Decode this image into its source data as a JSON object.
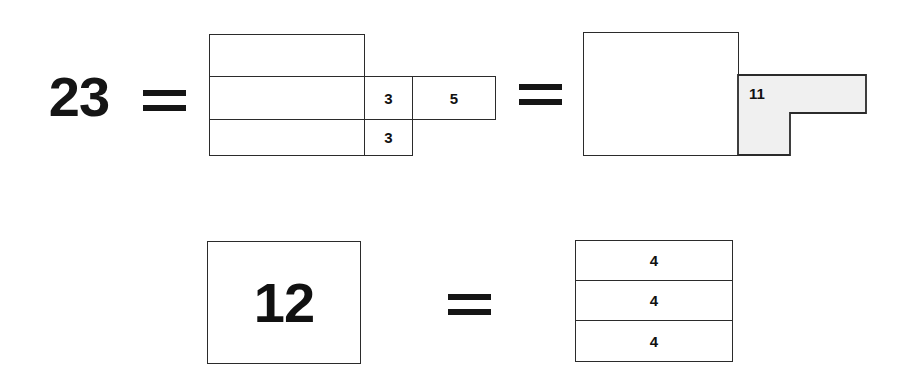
{
  "figure": {
    "background_color": "#ffffff",
    "line_color": "#2b2b2b",
    "text_color": "#111111",
    "shade_color": "#f0f0f0"
  },
  "equation_top": {
    "left_value": "23",
    "equals_1": "=",
    "equals_2": "=",
    "middle_group": {
      "block_rows": [
        "",
        "",
        ""
      ],
      "side_cells": [
        {
          "label": "3"
        },
        {
          "label": "3"
        }
      ],
      "far_cell": {
        "label": "5"
      }
    },
    "right_group": {
      "square_label": "",
      "lshape_label": "11"
    }
  },
  "equation_bottom": {
    "left_value": "12",
    "equals": "=",
    "stack_rows": [
      {
        "label": "4"
      },
      {
        "label": "4"
      },
      {
        "label": "4"
      }
    ]
  }
}
